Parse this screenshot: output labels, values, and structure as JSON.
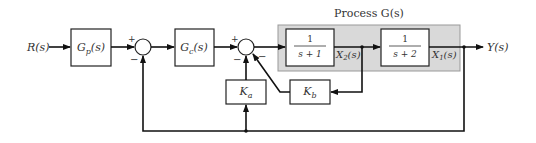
{
  "title": "Process G(s)",
  "input": {
    "label": "R(s)"
  },
  "output": {
    "label": "Y(s)"
  },
  "blocks": {
    "gp": {
      "label": "Gp(s)",
      "base": "G",
      "sub": "p",
      "tail": "(s)"
    },
    "gc": {
      "label": "Gc(s)",
      "base": "G",
      "sub": "c",
      "tail": "(s)"
    },
    "p1": {
      "num": "1",
      "den": "s + 1"
    },
    "p2": {
      "num": "1",
      "den": "s + 2"
    },
    "ka": {
      "label": "Ka",
      "base": "K",
      "sub": "a"
    },
    "kb": {
      "label": "Kb",
      "base": "K",
      "sub": "b"
    }
  },
  "signals": {
    "x2": {
      "label": "X2(s)",
      "base": "X",
      "sub": "2",
      "tail": "(s)"
    },
    "x1": {
      "label": "X1(s)",
      "base": "X",
      "sub": "1",
      "tail": "(s)"
    }
  },
  "summing_junctions": [
    {
      "id": "sum1",
      "plus": "+",
      "minus": "−"
    },
    {
      "id": "sum2",
      "plus": "+",
      "minus_left": "−",
      "minus_right": "−"
    }
  ],
  "colors": {
    "process_fill": "#d9d9d9",
    "process_stroke": "#999999",
    "line": "#111111"
  }
}
